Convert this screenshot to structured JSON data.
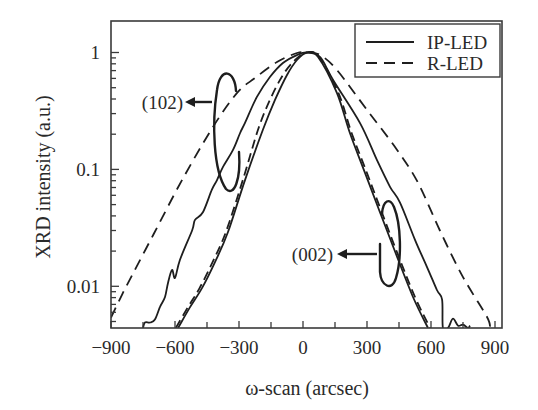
{
  "figure": {
    "xlabel": "ω-scan (arcsec)",
    "ylabel": "XRD intensity (a.u.)",
    "legend": {
      "entries": [
        {
          "label": "IP-LED",
          "style": "solid"
        },
        {
          "label": "R-LED",
          "style": "dashed"
        }
      ]
    },
    "annotations": [
      {
        "text": "(102)"
      },
      {
        "text": "(002)"
      }
    ]
  },
  "chart_data": {
    "type": "line",
    "title": "",
    "xlabel": "ω-scan (arcsec)",
    "ylabel": "XRD intensity (a.u.)",
    "xlim": [
      -900,
      933
    ],
    "ylim": [
      0.0044,
      1.86
    ],
    "yscale": "log",
    "xticks": [
      -900,
      -600,
      -300,
      0,
      300,
      600,
      900
    ],
    "xtick_labels": [
      "−900",
      "−600",
      "−300",
      "0",
      "300",
      "600",
      "900"
    ],
    "xminor_ticks": [
      -750,
      -450,
      -150,
      150,
      450,
      750
    ],
    "yticks": [
      0.01,
      0.1,
      1
    ],
    "ytick_labels": [
      "0.01",
      "0.1",
      "1"
    ],
    "grid": false,
    "legend": {
      "position": "upper right",
      "entries": [
        {
          "label": "IP-LED",
          "style": "solid"
        },
        {
          "label": "R-LED",
          "style": "dashed"
        }
      ]
    },
    "annotations": [
      {
        "text": "(102)",
        "x": -562,
        "y": 0.377,
        "arrow": "points left from loop enclosing the broad (102) curves"
      },
      {
        "text": "(002)",
        "x": 141,
        "y": 0.019,
        "arrow": "points left from loop enclosing the narrow (002) curves"
      }
    ],
    "series": [
      {
        "name": "R-LED (102)",
        "legend": "R-LED",
        "reflection": "(102)",
        "style": "dashed",
        "x": [
          -900,
          -848,
          -820,
          -700,
          -567,
          -422,
          -309,
          -225,
          -122,
          -28,
          19,
          80,
          159,
          300,
          441,
          539,
          642,
          750,
          862,
          877
        ],
        "y": [
          0.0054,
          0.0085,
          0.0107,
          0.028,
          0.081,
          0.231,
          0.451,
          0.605,
          0.829,
          0.99,
          1.0,
          0.952,
          0.709,
          0.323,
          0.147,
          0.077,
          0.03,
          0.012,
          0.0055,
          0.0044
        ]
      },
      {
        "name": "IP-LED (102)",
        "legend": "IP-LED",
        "reflection": "(102)",
        "style": "solid",
        "x": [
          -750,
          -741,
          -717,
          -694,
          -670,
          -647,
          -633,
          -614,
          -600,
          -577,
          -520,
          -506,
          -469,
          -427,
          -403,
          -375,
          -328,
          -295,
          -272,
          -216,
          -155,
          -94,
          -28,
          19,
          80,
          141,
          267,
          347,
          408,
          455,
          525,
          581,
          628,
          652,
          656,
          680,
          703,
          727,
          750,
          773,
          783
        ],
        "y": [
          0.0044,
          0.0049,
          0.0049,
          0.0052,
          0.0067,
          0.0081,
          0.0107,
          0.0138,
          0.0118,
          0.0168,
          0.03,
          0.037,
          0.043,
          0.067,
          0.081,
          0.105,
          0.147,
          0.205,
          0.25,
          0.417,
          0.617,
          0.813,
          0.952,
          1.0,
          0.916,
          0.582,
          0.25,
          0.12,
          0.071,
          0.052,
          0.025,
          0.0147,
          0.0093,
          0.0077,
          0.0044,
          0.0044,
          0.0053,
          0.0046,
          0.0047,
          0.0044,
          0.0046
        ]
      },
      {
        "name": "R-LED (002)",
        "legend": "R-LED",
        "reflection": "(002)",
        "style": "dashed",
        "x": [
          -596,
          -540,
          -484,
          -423,
          -362,
          -282,
          -211,
          -155,
          -94,
          -37,
          19,
          75,
          166,
          228,
          300,
          430,
          525,
          596
        ],
        "y": [
          0.0044,
          0.0066,
          0.0097,
          0.0162,
          0.029,
          0.081,
          0.218,
          0.393,
          0.642,
          0.863,
          1.0,
          0.92,
          0.451,
          0.205,
          0.093,
          0.022,
          0.0081,
          0.0044
        ]
      },
      {
        "name": "IP-LED (002)",
        "legend": "IP-LED",
        "reflection": "(002)",
        "style": "solid",
        "x": [
          -586,
          -530,
          -473,
          -412,
          -352,
          -272,
          -188,
          -131,
          -75,
          -28,
          19,
          70,
          159,
          220,
          291,
          422,
          516,
          586
        ],
        "y": [
          0.0044,
          0.0066,
          0.0097,
          0.0162,
          0.029,
          0.081,
          0.218,
          0.393,
          0.642,
          0.863,
          1.0,
          0.92,
          0.451,
          0.205,
          0.093,
          0.022,
          0.0081,
          0.0044
        ]
      }
    ]
  }
}
